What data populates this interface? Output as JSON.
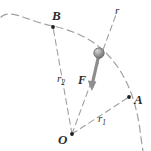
{
  "figure": {
    "type": "physics-diagram",
    "background_color": "#ffffff",
    "stroke_color": "#8a8a8a",
    "label_color": "#2b2b2b",
    "force_color": "#808080",
    "particle_color": "#9a9a9a"
  },
  "labels": {
    "point_b": "B",
    "point_a": "A",
    "origin": "O",
    "radius_current": "r",
    "radius_1_base": "r",
    "radius_1_sub": "1",
    "radius_2_base": "r",
    "radius_2_sub": "2",
    "force": "F"
  },
  "geometry": {
    "origin": {
      "x": 72,
      "y": 134
    },
    "point_a": {
      "x": 128,
      "y": 98
    },
    "point_b": {
      "x": 53,
      "y": 26
    },
    "particle": {
      "x": 99,
      "y": 53,
      "radius": 5
    },
    "force_vector": {
      "from_x": 99,
      "from_y": 53,
      "to_x": 92,
      "to_y": 89
    },
    "arc_radius": 86,
    "line_r_end": {
      "x": 117,
      "y": 13
    }
  }
}
